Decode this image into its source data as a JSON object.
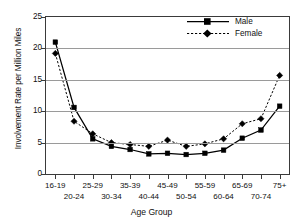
{
  "chart_data": {
    "type": "line",
    "title": "",
    "xlabel": "Age Group",
    "ylabel": "Involvement Rate per Million Miles",
    "categories": [
      "16-19",
      "20-24",
      "25-29",
      "30-34",
      "35-39",
      "40-44",
      "45-49",
      "50-54",
      "55-59",
      "60-64",
      "65-69",
      "70-74",
      "75+"
    ],
    "series": [
      {
        "name": "Male",
        "marker": "square",
        "linestyle": "solid",
        "color": "#000000",
        "values": [
          21.0,
          10.6,
          5.6,
          4.4,
          3.9,
          3.2,
          3.3,
          3.1,
          3.3,
          3.8,
          5.7,
          7.0,
          10.8
        ]
      },
      {
        "name": "Female",
        "marker": "diamond",
        "linestyle": "dotted",
        "color": "#000000",
        "values": [
          19.2,
          8.4,
          6.4,
          5.0,
          4.7,
          4.4,
          5.4,
          4.4,
          4.8,
          5.6,
          8.0,
          8.8,
          15.7
        ]
      }
    ],
    "ylim": [
      0,
      25
    ],
    "yticks": [
      0,
      5,
      10,
      15,
      20,
      25
    ],
    "ytick_labels": [
      "0",
      "5",
      "10",
      "15",
      "20",
      "25"
    ],
    "grid": "horizontal",
    "grid_color": "#9a9a9a",
    "legend_position": "top-right",
    "frame": true,
    "background": "#ffffff"
  },
  "legend": {
    "entries": [
      {
        "label": "Male"
      },
      {
        "label": "Female"
      }
    ]
  },
  "axes": {
    "x_title": "Age Group",
    "y_title": "Involvement Rate per Million Miles"
  }
}
